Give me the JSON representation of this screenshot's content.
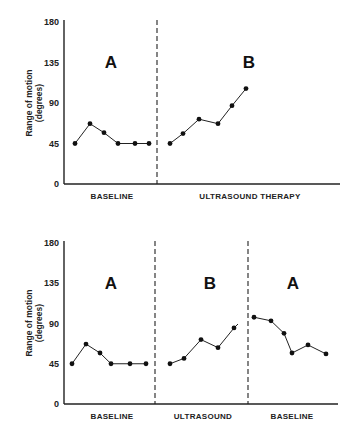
{
  "chart_data": [
    {
      "type": "line",
      "title": "",
      "ylabel": "Range of motion (degrees)",
      "ylim": [
        0,
        180
      ],
      "yticks": [
        0,
        45,
        90,
        135,
        180
      ],
      "grid": false,
      "phases": [
        {
          "name": "A",
          "label": "BASELINE",
          "values": [
            45,
            67,
            57,
            45,
            45,
            45
          ]
        },
        {
          "name": "B",
          "label": "ULTRASOUND THERAPY",
          "values": [
            45,
            56,
            72,
            67,
            87,
            106
          ]
        }
      ]
    },
    {
      "type": "line",
      "title": "",
      "ylabel": "Range of motion (degrees)",
      "ylim": [
        0,
        180
      ],
      "yticks": [
        0,
        45,
        90,
        135,
        180
      ],
      "grid": false,
      "phases": [
        {
          "name": "A",
          "label": "BASELINE",
          "values": [
            45,
            67,
            57,
            45,
            45,
            45
          ]
        },
        {
          "name": "B",
          "label": "ULTRASOUND",
          "values": [
            45,
            51,
            72,
            63,
            85
          ]
        },
        {
          "name": "A",
          "label": "BASELINE",
          "values": [
            97,
            93,
            79,
            57,
            66,
            56
          ]
        }
      ]
    }
  ],
  "layout": {
    "charts": [
      {
        "x0": 64,
        "x1": 340,
        "y0": 184,
        "y180": 22,
        "ylabel_x": 32,
        "ylabel_y": 103,
        "dividers": [
          157
        ],
        "phase_letter_y": 68,
        "xlabel_y": 199,
        "phases": [
          {
            "xs": [
              75,
              90,
              104,
              118,
              135,
              149
            ],
            "letter_x": 111,
            "label_x": 112
          },
          {
            "xs": [
              170,
              183,
              199,
              218,
              232,
              246
            ],
            "letter_x": 249,
            "label_x": 250
          }
        ]
      },
      {
        "x0": 64,
        "x1": 338,
        "y0": 404,
        "y180": 243,
        "ylabel_x": 32,
        "ylabel_y": 323,
        "dividers": [
          155,
          248
        ],
        "phase_letter_y": 289,
        "xlabel_y": 419,
        "phases": [
          {
            "xs": [
              72,
              86,
              100,
              111,
              130,
              146
            ],
            "letter_x": 111,
            "label_x": 112
          },
          {
            "xs": [
              170,
              184,
              201,
              218,
              234
            ],
            "letter_x": 210,
            "label_x": 203,
            "tail": [
              238,
              324
            ]
          },
          {
            "xs": [
              254,
              271,
              284,
              292,
              308,
              326
            ],
            "letter_x": 293,
            "label_x": 292
          }
        ]
      }
    ]
  }
}
